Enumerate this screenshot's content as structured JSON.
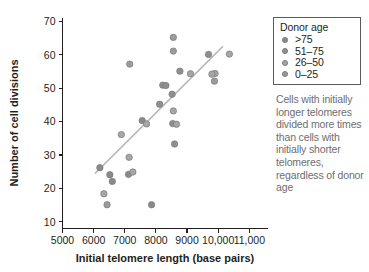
{
  "chart_data": {
    "type": "scatter",
    "title": "",
    "xlabel": "Initial telomere length (base pairs)",
    "ylabel": "Number of cell divisions",
    "xlim": [
      5000,
      11600
    ],
    "ylim": [
      8,
      71
    ],
    "xticks": [
      5000,
      6000,
      7000,
      8000,
      9000,
      10000,
      11000
    ],
    "xticklabels": [
      "5000",
      "6000",
      "7000",
      "8000",
      "9000",
      "10,000",
      "11,000"
    ],
    "yticks": [
      10,
      20,
      30,
      40,
      50,
      60,
      70
    ],
    "yticklabels": [
      "10",
      "20",
      "30",
      "40",
      "50",
      "60",
      "70"
    ],
    "grid": false,
    "legend_position": "top-right",
    "series": [
      {
        "name": ">75",
        "color": "#8a8a8a",
        "points": [
          {
            "x": 6200,
            "y": 26.2
          },
          {
            "x": 6520,
            "y": 24.1
          },
          {
            "x": 6600,
            "y": 22.1
          },
          {
            "x": 7120,
            "y": 24.2
          },
          {
            "x": 7560,
            "y": 40.3
          },
          {
            "x": 7860,
            "y": 15.1
          }
        ]
      },
      {
        "name": "51–75",
        "color": "#8f8f8f",
        "points": [
          {
            "x": 8120,
            "y": 45.2
          },
          {
            "x": 8220,
            "y": 50.9
          },
          {
            "x": 8320,
            "y": 50.8
          },
          {
            "x": 8520,
            "y": 48.2
          },
          {
            "x": 8600,
            "y": 33.3
          },
          {
            "x": 8770,
            "y": 55.1
          },
          {
            "x": 8540,
            "y": 39.4
          },
          {
            "x": 9690,
            "y": 60.1
          }
        ]
      },
      {
        "name": "26–50",
        "color": "#a6a6a6",
        "points": [
          {
            "x": 6330,
            "y": 18.4
          },
          {
            "x": 6890,
            "y": 36.1
          },
          {
            "x": 7140,
            "y": 29.3
          },
          {
            "x": 7260,
            "y": 24.9
          },
          {
            "x": 7700,
            "y": 39.3
          },
          {
            "x": 8560,
            "y": 43.2
          },
          {
            "x": 8660,
            "y": 39.2
          },
          {
            "x": 9110,
            "y": 54.3
          },
          {
            "x": 9900,
            "y": 54.4
          },
          {
            "x": 9800,
            "y": 54.2
          },
          {
            "x": 10360,
            "y": 60.2
          }
        ]
      },
      {
        "name": "0–25",
        "color": "#9b9b9b",
        "points": [
          {
            "x": 6430,
            "y": 15.1
          },
          {
            "x": 7160,
            "y": 57.2
          },
          {
            "x": 8560,
            "y": 65.2
          },
          {
            "x": 8560,
            "y": 61.1
          },
          {
            "x": 9880,
            "y": 52.1
          }
        ]
      }
    ],
    "trendline": {
      "x1": 6060,
      "y1": 24.6,
      "x2": 10140,
      "y2": 62.4,
      "color": "#b4b4b4"
    }
  },
  "legend": {
    "title": "Donor age",
    "items": [
      {
        "label": ">75",
        "color": "#8a8a8a"
      },
      {
        "label": "51–75",
        "color": "#8f8f8f"
      },
      {
        "label": "26–50",
        "color": "#a6a6a6"
      },
      {
        "label": "0–25",
        "color": "#9b9b9b"
      }
    ]
  },
  "annotation": {
    "text": "Cells with initially longer telomeres divided more times than cells with initially shorter telomeres, regardless of donor age"
  }
}
